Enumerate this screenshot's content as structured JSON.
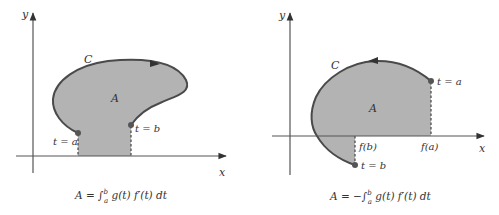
{
  "left_panel": {
    "axis_x_label": "x",
    "axis_y_label": "y",
    "curve_label": "C",
    "area_label": "A",
    "point_start_label": "t = a",
    "point_end_label": "t = b",
    "curve_direction": "clockwise (arrow pointing right along top)",
    "formula": "A = ∫ₐᵇ g(t) f′(t) dt",
    "formula_parts": {
      "lhs": "A = ",
      "integral": "∫",
      "upper": "b",
      "lower": "a",
      "integrand": " g(t) f′(t) dt"
    }
  },
  "right_panel": {
    "axis_x_label": "x",
    "axis_y_label": "y",
    "curve_label": "C",
    "area_label": "A",
    "point_start_label": "t = a",
    "point_end_label": "t = b",
    "tick_fb_label": "f(b)",
    "tick_fa_label": "f(a)",
    "curve_direction": "counterclockwise (arrow pointing left along top)",
    "formula": "A = −∫ₐᵇ g(t) f′(t) dt",
    "formula_parts": {
      "lhs": "A = −",
      "integral": "∫",
      "upper": "b",
      "lower": "a",
      "integrand": " g(t) f′(t) dt"
    }
  },
  "colors": {
    "fill": "#b3b3b3",
    "curve": "#4a4a4a",
    "axis": "#555555",
    "point": "#555555"
  }
}
